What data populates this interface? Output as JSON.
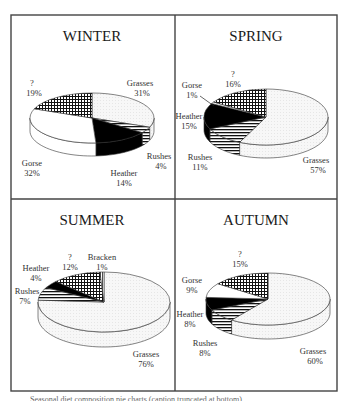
{
  "figure": {
    "caption": "Seasonal diet composition pie charts (caption truncated at bottom)"
  },
  "chart_data": [
    {
      "type": "pie",
      "title": "WINTER",
      "categories": [
        "Grasses",
        "Rushes",
        "Heather",
        "Gorse",
        "?"
      ],
      "values": [
        31,
        4,
        14,
        32,
        19
      ],
      "labels": [
        "Grasses\n31%",
        "Rushes\n4%",
        "Heather\n14%",
        "Gorse\n32%",
        "?\n19%"
      ]
    },
    {
      "type": "pie",
      "title": "SPRING",
      "categories": [
        "Grasses",
        "Rushes",
        "Heather",
        "Gorse",
        "?"
      ],
      "values": [
        57,
        11,
        15,
        1,
        16
      ]
    },
    {
      "type": "pie",
      "title": "SUMMER",
      "categories": [
        "Grasses",
        "Rushes",
        "Heather",
        "?",
        "Bracken"
      ],
      "values": [
        76,
        7,
        4,
        12,
        1
      ]
    },
    {
      "type": "pie",
      "title": "AUTUMN",
      "categories": [
        "Grasses",
        "Rushes",
        "Heather",
        "Gorse",
        "?"
      ],
      "values": [
        60,
        8,
        8,
        9,
        15
      ]
    }
  ],
  "panels": {
    "winter": {
      "title": "WINTER",
      "labels": {
        "grasses": {
          "name": "Grasses",
          "pct": "31%"
        },
        "rushes": {
          "name": "Rushes",
          "pct": "4%"
        },
        "heather": {
          "name": "Heather",
          "pct": "14%"
        },
        "gorse": {
          "name": "Gorse",
          "pct": "32%"
        },
        "unknown": {
          "name": "?",
          "pct": "19%"
        }
      }
    },
    "spring": {
      "title": "SPRING",
      "labels": {
        "grasses": {
          "name": "Grasses",
          "pct": "57%"
        },
        "rushes": {
          "name": "Rushes",
          "pct": "11%"
        },
        "heather": {
          "name": "Heather",
          "pct": "15%"
        },
        "gorse": {
          "name": "Gorse",
          "pct": "1%"
        },
        "unknown": {
          "name": "?",
          "pct": "16%"
        }
      }
    },
    "summer": {
      "title": "SUMMER",
      "labels": {
        "grasses": {
          "name": "Grasses",
          "pct": "76%"
        },
        "rushes": {
          "name": "Rushes",
          "pct": "7%"
        },
        "heather": {
          "name": "Heather",
          "pct": "4%"
        },
        "unknown": {
          "name": "?",
          "pct": "12%"
        },
        "bracken": {
          "name": "Bracken",
          "pct": "1%"
        }
      }
    },
    "autumn": {
      "title": "AUTUMN",
      "labels": {
        "grasses": {
          "name": "Grasses",
          "pct": "60%"
        },
        "rushes": {
          "name": "Rushes",
          "pct": "8%"
        },
        "heather": {
          "name": "Heather",
          "pct": "8%"
        },
        "gorse": {
          "name": "Gorse",
          "pct": "9%"
        },
        "unknown": {
          "name": "?",
          "pct": "15%"
        }
      }
    }
  },
  "colors": {
    "frame": "#444444",
    "grasses": "#f4f4f4",
    "heather": "#000000",
    "gorse": "#ffffff",
    "outline": "#333333"
  }
}
